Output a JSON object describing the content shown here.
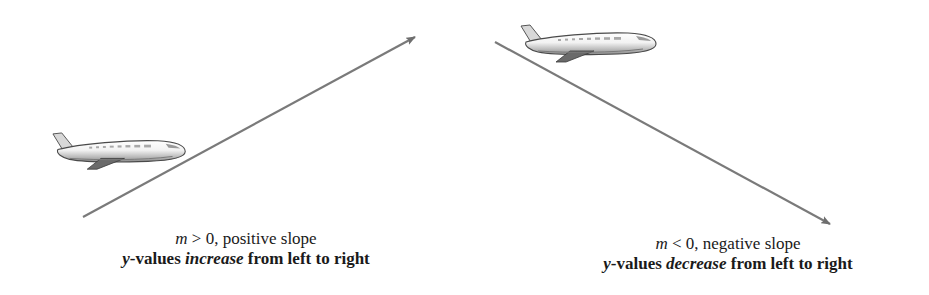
{
  "panels": [
    {
      "id": "positive",
      "line": {
        "x1": 83,
        "y1": 217,
        "x2": 415,
        "y2": 37,
        "color": "#7a7a7a"
      },
      "caption": {
        "var": "m",
        "relation": " > 0, positive slope",
        "line2_var": "y",
        "line2_pre": "-values ",
        "line2_emph": "increase",
        "line2_post": " from left to right"
      },
      "airplane": {
        "x": 50,
        "y": 130,
        "direction": "right"
      }
    },
    {
      "id": "negative",
      "line": {
        "x1": 495,
        "y1": 42,
        "x2": 830,
        "y2": 224,
        "color": "#7a7a7a"
      },
      "caption": {
        "var": "m",
        "relation": " < 0, negative slope",
        "line2_var": "y",
        "line2_pre": "-values ",
        "line2_emph": "decrease",
        "line2_post": " from left to right"
      },
      "airplane": {
        "x": 518,
        "y": 22,
        "direction": "right"
      }
    }
  ],
  "icons": [
    "airplane-icon",
    "arrow-up-right-icon",
    "arrow-down-right-icon"
  ]
}
